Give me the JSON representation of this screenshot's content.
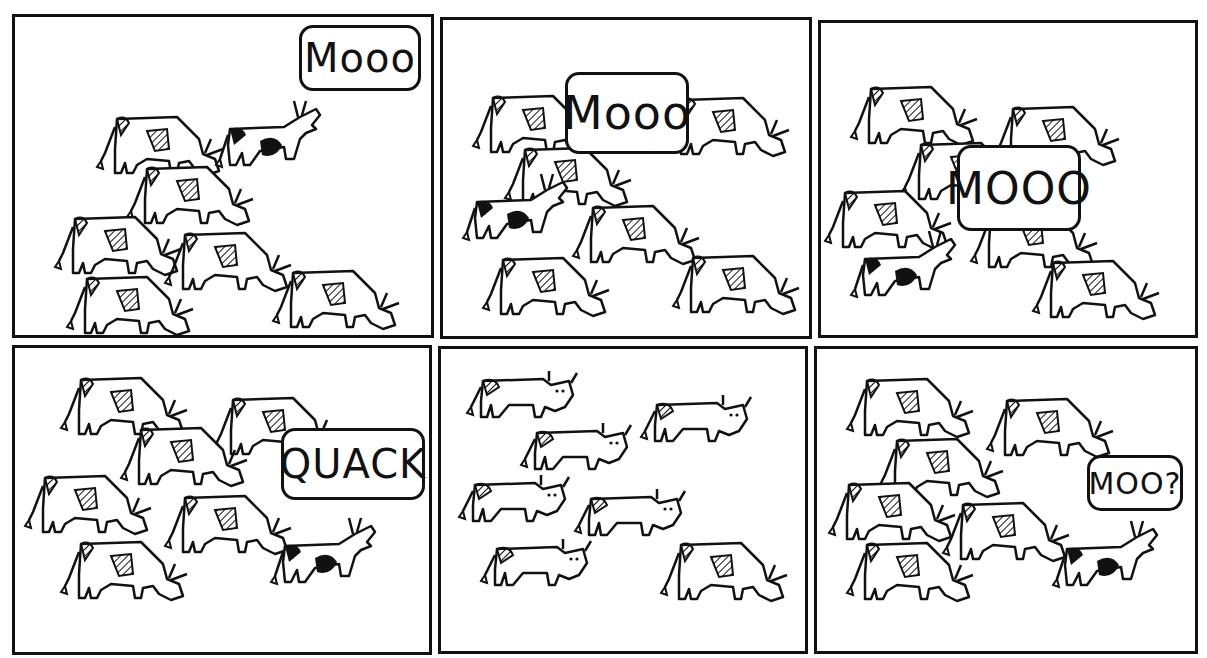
{
  "comic": {
    "panels": [
      {
        "id": 1,
        "speech": "Mooo",
        "speaker": "black-spotted cow raising head"
      },
      {
        "id": 2,
        "speech": "Mooo",
        "speaker": "black-spotted cow in middle"
      },
      {
        "id": 3,
        "speech": "MOOO",
        "speaker": "black-spotted cow raising head"
      },
      {
        "id": 4,
        "speech": "QUACK",
        "speaker": "black-spotted cow raising head"
      },
      {
        "id": 5,
        "speech": "",
        "speaker": "all cows staring at camera"
      },
      {
        "id": 6,
        "speech": "MOO?",
        "speaker": "black-spotted cow raising head"
      }
    ]
  },
  "colors": {
    "ink": "#111111",
    "paper": "#ffffff"
  }
}
